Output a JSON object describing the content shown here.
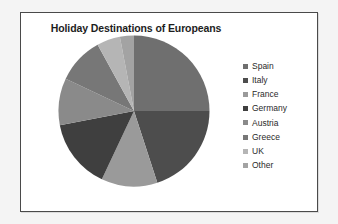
{
  "chart_data": {
    "type": "pie",
    "title": "Holiday Destinations of Europeans",
    "xlabel": "",
    "ylabel": "",
    "legend_position": "right",
    "grid": false,
    "start_angle_deg": 0,
    "direction": "clockwise",
    "categories": [
      "Spain",
      "Italy",
      "France",
      "Germany",
      "Austria",
      "Greece",
      "UK",
      "Other"
    ],
    "values": [
      25,
      20,
      12,
      15,
      10,
      10,
      5,
      3
    ],
    "value_unit": "percent",
    "colors": [
      "#6f6f6f",
      "#4d4d4d",
      "#9a9a9a",
      "#3f3f3f",
      "#8a8a8a",
      "#777777",
      "#b5b5b5",
      "#a3a3a3"
    ],
    "slices": [
      {
        "label": "Spain",
        "value": 25,
        "color": "#6f6f6f"
      },
      {
        "label": "Italy",
        "value": 20,
        "color": "#4d4d4d"
      },
      {
        "label": "France",
        "value": 12,
        "color": "#9a9a9a"
      },
      {
        "label": "Germany",
        "value": 15,
        "color": "#3f3f3f"
      },
      {
        "label": "Austria",
        "value": 10,
        "color": "#8a8a8a"
      },
      {
        "label": "Greece",
        "value": 10,
        "color": "#777777"
      },
      {
        "label": "UK",
        "value": 5,
        "color": "#b5b5b5"
      },
      {
        "label": "Other",
        "value": 3,
        "color": "#a3a3a3"
      }
    ]
  },
  "chart": {
    "title": "Holiday Destinations of Europeans",
    "frame_color": "#4a4a4a",
    "background": "#ffffff"
  },
  "legend": {
    "items": [
      {
        "label": "Spain",
        "color": "#6f6f6f"
      },
      {
        "label": "Italy",
        "color": "#4d4d4d"
      },
      {
        "label": "France",
        "color": "#9a9a9a"
      },
      {
        "label": "Germany",
        "color": "#3f3f3f"
      },
      {
        "label": "Austria",
        "color": "#8a8a8a"
      },
      {
        "label": "Greece",
        "color": "#777777"
      },
      {
        "label": "UK",
        "color": "#b5b5b5"
      },
      {
        "label": "Other",
        "color": "#a3a3a3"
      }
    ]
  }
}
